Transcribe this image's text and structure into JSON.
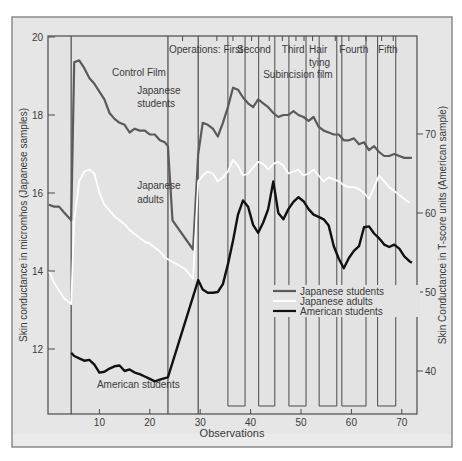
{
  "chart_data": {
    "type": "line",
    "title": "",
    "xlabel": "Observations",
    "ylabel": "Skin conductance in micromhos (Japanese samples)",
    "ylabel_right": "Skin Conductance in T-score units (American sample)",
    "xlim": [
      0,
      72
    ],
    "ylim": [
      10.5,
      20
    ],
    "ylim_right": [
      37.5,
      80
    ],
    "x_ticks": [
      10,
      20,
      30,
      40,
      50,
      60,
      70
    ],
    "y_ticks": [
      12,
      14,
      16,
      18,
      20
    ],
    "y_ticks_right": [
      40,
      50,
      60,
      70
    ],
    "grid": false,
    "legend_position": "lower-middle-right",
    "legend": [
      {
        "label": "Japanese students",
        "color": "#5a5a5a"
      },
      {
        "label": "Japanese adults",
        "color": "#ffffff"
      },
      {
        "label": "American students",
        "color": "#111111"
      }
    ],
    "annotations": [
      {
        "text": "Control Film",
        "x": 12.5,
        "y": 19.0
      },
      {
        "text": "Japanese",
        "x": 17.5,
        "y": 18.55
      },
      {
        "text": "students",
        "x": 17.5,
        "y": 18.2
      },
      {
        "text": "Japanese",
        "x": 17.5,
        "y": 16.1
      },
      {
        "text": "adults",
        "x": 17.5,
        "y": 15.75
      },
      {
        "text": "American students",
        "x": 9.5,
        "y": 11.0
      },
      {
        "text": "Operations: First",
        "x": 23.8,
        "y": 19.6
      },
      {
        "text": "Second",
        "x": 37.3,
        "y": 19.6
      },
      {
        "text": "Third",
        "x": 46.2,
        "y": 19.6
      },
      {
        "text": "Hair",
        "x": 51.6,
        "y": 19.6
      },
      {
        "text": "tying",
        "x": 51.6,
        "y": 19.25
      },
      {
        "text": "Subincision film",
        "x": 42.5,
        "y": 18.95
      },
      {
        "text": "Fourth",
        "x": 57.6,
        "y": 19.6
      },
      {
        "text": "Fifth",
        "x": 65.3,
        "y": 19.6
      }
    ],
    "segment_boundaries": [
      4.4,
      23.6,
      29.6
    ],
    "operation_boxes": [
      [
        35.5,
        38.9
      ],
      [
        41.6,
        44.8
      ],
      [
        47.6,
        51.0
      ],
      [
        53.6,
        57.1
      ],
      [
        58.1,
        62.9
      ],
      [
        65.2,
        68.8
      ]
    ],
    "series": [
      {
        "name": "Japanese students",
        "axis": "left",
        "x": [
          0,
          1,
          2,
          3,
          4.4,
          5.0,
          6.0,
          7.0,
          8.0,
          9.0,
          10.0,
          11.0,
          12.0,
          13.0,
          14.0,
          15.0,
          16.0,
          17.0,
          18.0,
          19.0,
          20.0,
          21.0,
          22.0,
          23.0,
          23.6,
          24.5,
          28.6,
          29.6,
          30.5,
          31.5,
          32.5,
          33.5,
          34.5,
          35.5,
          36.5,
          37.5,
          38.5,
          39.5,
          40.5,
          41.5,
          42.5,
          43.5,
          44.5,
          45.5,
          46.5,
          47.5,
          48.5,
          49.5,
          50.5,
          51.5,
          52.5,
          53.5,
          54.5,
          55.5,
          56.5,
          57.5,
          58.5,
          59.5,
          60.5,
          61.5,
          62.5,
          63.5,
          64.5,
          65.5,
          66.5,
          67.5,
          68.5,
          69.5,
          70.5,
          71.5,
          72.0
        ],
        "values": [
          15.7,
          15.65,
          15.65,
          15.5,
          15.3,
          19.35,
          19.4,
          19.2,
          18.95,
          18.8,
          18.6,
          18.4,
          18.05,
          17.9,
          17.8,
          17.75,
          17.55,
          17.65,
          17.6,
          17.6,
          17.5,
          17.5,
          17.35,
          17.3,
          17.2,
          15.3,
          14.55,
          17.0,
          17.8,
          17.75,
          17.65,
          17.45,
          17.8,
          18.2,
          18.7,
          18.65,
          18.45,
          18.3,
          18.2,
          18.4,
          18.3,
          18.2,
          18.05,
          17.95,
          18.0,
          18.0,
          18.1,
          18.0,
          17.95,
          17.85,
          17.95,
          17.7,
          17.6,
          17.55,
          17.5,
          17.5,
          17.35,
          17.35,
          17.4,
          17.25,
          17.3,
          17.1,
          17.2,
          17.05,
          16.95,
          16.95,
          17.0,
          16.95,
          16.9,
          16.9,
          16.9
        ]
      },
      {
        "name": "Japanese adults",
        "axis": "left",
        "x": [
          0,
          1,
          2,
          3,
          4.4,
          5.0,
          6.0,
          7.0,
          8.0,
          9.0,
          10.0,
          11.0,
          12.0,
          13.0,
          14.0,
          15.0,
          16.0,
          17.0,
          18.0,
          19.0,
          20.0,
          21.0,
          22.0,
          23.0,
          23.6,
          25.0,
          27.0,
          28.6,
          29.6,
          30.5,
          31.5,
          32.5,
          33.5,
          34.5,
          35.5,
          36.5,
          37.5,
          38.5,
          39.5,
          40.5,
          41.5,
          42.5,
          43.5,
          44.5,
          45.5,
          46.5,
          47.5,
          48.5,
          49.5,
          50.5,
          51.5,
          52.5,
          53.5,
          54.5,
          55.5,
          56.5,
          57.5,
          58.5,
          59.5,
          60.5,
          61.5,
          62.5,
          63.5,
          64.5,
          65.5,
          66.5,
          67.5,
          68.5,
          69.5,
          70.5,
          71.5
        ],
        "values": [
          14.0,
          13.7,
          13.5,
          13.3,
          13.15,
          15.3,
          16.3,
          16.55,
          16.6,
          16.5,
          16.0,
          15.7,
          15.55,
          15.4,
          15.3,
          15.2,
          15.05,
          14.95,
          14.85,
          14.75,
          14.7,
          14.6,
          14.5,
          14.35,
          14.3,
          14.2,
          14.05,
          13.8,
          16.3,
          16.45,
          16.55,
          16.5,
          16.3,
          16.4,
          16.55,
          16.85,
          16.7,
          16.45,
          16.5,
          16.65,
          16.8,
          16.75,
          16.6,
          16.75,
          16.8,
          16.7,
          16.5,
          16.55,
          16.6,
          16.45,
          16.5,
          16.6,
          16.45,
          16.3,
          16.4,
          16.35,
          16.3,
          16.2,
          16.15,
          16.15,
          16.1,
          16.0,
          15.85,
          16.15,
          16.45,
          16.3,
          16.15,
          16.05,
          15.95,
          15.85,
          15.75
        ]
      },
      {
        "name": "American students",
        "axis": "right",
        "x": [
          4.4,
          5.0,
          6.0,
          7.0,
          8.0,
          9.0,
          10.0,
          11.0,
          12.0,
          13.0,
          14.0,
          15.0,
          16.0,
          17.0,
          18.0,
          19.0,
          20.0,
          21.0,
          22.0,
          23.0,
          23.6,
          29.6,
          30.5,
          31.5,
          32.5,
          33.5,
          34.5,
          35.5,
          36.5,
          37.5,
          38.5,
          39.5,
          40.5,
          41.5,
          42.5,
          43.5,
          44.5,
          45.5,
          46.5,
          47.5,
          48.5,
          49.5,
          50.5,
          51.5,
          52.5,
          53.5,
          54.5,
          55.5,
          56.5,
          57.5,
          58.5,
          59.5,
          60.5,
          61.5,
          62.5,
          63.5,
          64.5,
          65.5,
          66.5,
          67.5,
          68.5,
          69.5,
          70.5,
          71.5,
          72.0
        ],
        "values": [
          42.3,
          41.9,
          41.6,
          41.3,
          41.4,
          40.8,
          39.8,
          39.9,
          40.3,
          40.6,
          40.7,
          40.0,
          40.2,
          39.8,
          39.6,
          39.3,
          39.0,
          38.7,
          38.9,
          39.1,
          39.2,
          51.5,
          50.3,
          49.9,
          49.9,
          50.0,
          51.0,
          53.5,
          56.5,
          59.8,
          61.6,
          60.8,
          58.5,
          57.5,
          58.8,
          60.5,
          64.0,
          60.0,
          59.2,
          60.5,
          61.4,
          62.0,
          61.5,
          60.5,
          59.8,
          59.5,
          59.2,
          58.4,
          55.8,
          54.2,
          53.0,
          54.3,
          55.2,
          55.8,
          58.2,
          58.3,
          57.4,
          56.8,
          56.0,
          55.7,
          56.0,
          55.5,
          54.5,
          53.9,
          53.7
        ]
      }
    ]
  }
}
